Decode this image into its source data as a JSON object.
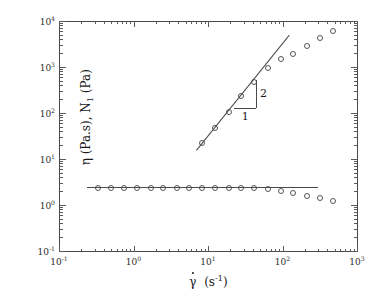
{
  "chart_data": {
    "type": "scatter",
    "title": "",
    "xlabel": "γ̇ (s⁻¹)",
    "ylabel": "η (Pa.s), N₁ (Pa)",
    "xscale": "log",
    "yscale": "log",
    "xlim": [
      0.1,
      1000
    ],
    "ylim": [
      0.1,
      10000
    ],
    "grid": false,
    "legend": "none",
    "x_tick_labels": [
      "10⁻¹",
      "10⁰",
      "10¹",
      "10²",
      "10³"
    ],
    "x_tick_values": [
      0.1,
      1,
      10,
      100,
      1000
    ],
    "y_tick_labels": [
      "10⁻¹",
      "10⁰",
      "10¹",
      "10²",
      "10³",
      "10⁴"
    ],
    "y_tick_values": [
      0.1,
      1,
      10,
      100,
      1000,
      10000
    ],
    "series": [
      {
        "name": "η (Pa.s)",
        "marker": "open-circle",
        "x": [
          0.33,
          0.5,
          0.75,
          1.1,
          1.7,
          2.5,
          3.8,
          5.6,
          8.4,
          12.6,
          19,
          28,
          42,
          63,
          95,
          140,
          215,
          320,
          480
        ],
        "y": [
          2.4,
          2.4,
          2.4,
          2.4,
          2.4,
          2.4,
          2.35,
          2.35,
          2.35,
          2.3,
          2.3,
          2.3,
          2.3,
          2.25,
          2.0,
          1.8,
          1.6,
          1.4,
          1.25
        ]
      },
      {
        "name": "N₁ (Pa)",
        "marker": "open-circle",
        "x": [
          8.4,
          12.6,
          19,
          28,
          42,
          63,
          95,
          140,
          215,
          320,
          480
        ],
        "y": [
          22,
          48,
          105,
          230,
          480,
          950,
          1500,
          1900,
          2900,
          4300,
          6000
        ]
      }
    ],
    "fit_lines": [
      {
        "name": "power-law-slope-2-fit",
        "x1": 7.0,
        "y1": 16,
        "x2": 125,
        "y2": 5200,
        "slope": 2
      },
      {
        "name": "zero-shear-viscosity-plateau",
        "x1": 0.24,
        "y1": 2.42,
        "x2": 300,
        "y2": 2.42,
        "slope": 0
      }
    ],
    "annotations": {
      "slope_triangle": {
        "rise_label": "2",
        "run_label": "1",
        "description": "slope-2 reference triangle"
      }
    }
  },
  "axes": {
    "x_title": "γ̇ (s⁻¹)",
    "y_title": "η (Pa.s), N₁ (Pa)"
  }
}
